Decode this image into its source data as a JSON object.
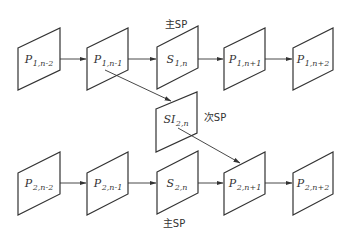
{
  "diagram": {
    "type": "SP/SI frame switching",
    "rows": [
      {
        "name": "stream-1",
        "frames": [
          {
            "id": "p1-n-2",
            "main": "P",
            "sub": "1,n-2",
            "type": "P"
          },
          {
            "id": "p1-n-1",
            "main": "P",
            "sub": "1,n-1",
            "type": "P"
          },
          {
            "id": "s1-n",
            "main": "S",
            "sub": "1,n",
            "type": "SP"
          },
          {
            "id": "p1-n+1",
            "main": "P",
            "sub": "1,n+1",
            "type": "P"
          },
          {
            "id": "p1-n+2",
            "main": "P",
            "sub": "1,n+2",
            "type": "P"
          }
        ]
      },
      {
        "name": "switch",
        "frames": [
          {
            "id": "si2-n",
            "main": "SI",
            "sub": "2,n",
            "type": "SI"
          }
        ]
      },
      {
        "name": "stream-2",
        "frames": [
          {
            "id": "p2-n-2",
            "main": "P",
            "sub": "2,n-2",
            "type": "P"
          },
          {
            "id": "p2-n-1",
            "main": "P",
            "sub": "2,n-1",
            "type": "P"
          },
          {
            "id": "s2-n",
            "main": "S",
            "sub": "2,n",
            "type": "SP"
          },
          {
            "id": "p2-n+1",
            "main": "P",
            "sub": "2,n+1",
            "type": "P"
          },
          {
            "id": "p2-n+2",
            "main": "P",
            "sub": "2,n+2",
            "type": "P"
          }
        ]
      }
    ],
    "labels": {
      "primary_sp_top": "主SP",
      "secondary_sp": "次SP",
      "primary_sp_bottom": "主SP"
    },
    "edges": [
      {
        "from": "p1-n-2",
        "to": "p1-n-1"
      },
      {
        "from": "p1-n-1",
        "to": "s1-n"
      },
      {
        "from": "s1-n",
        "to": "p1-n+1"
      },
      {
        "from": "p1-n+1",
        "to": "p1-n+2"
      },
      {
        "from": "p1-n-1",
        "to": "si2-n"
      },
      {
        "from": "si2-n",
        "to": "p2-n+1"
      },
      {
        "from": "p2-n-2",
        "to": "p2-n-1"
      },
      {
        "from": "p2-n-1",
        "to": "s2-n"
      },
      {
        "from": "s2-n",
        "to": "p2-n+1"
      },
      {
        "from": "p2-n+1",
        "to": "p2-n+2"
      }
    ],
    "colors": {
      "stroke": "#333333",
      "background": "#ffffff"
    }
  }
}
